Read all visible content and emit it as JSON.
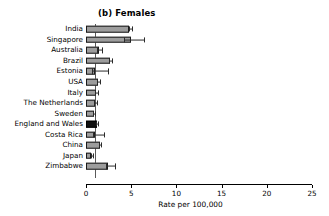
{
  "panel": {
    "label": "(b) Females"
  },
  "axis": {
    "title": "Rate per 100,000",
    "ticks": [
      "0",
      "5",
      "10",
      "15",
      "20",
      "25"
    ],
    "min": 0,
    "max": 25,
    "step": 5
  },
  "colors": {
    "bar_fill": "#9d9d9d",
    "bar_stroke": "#1a1a1a",
    "highlight_fill": "#111111",
    "error_bar": "#2b2b2b",
    "reference_line": "#5a5a5a",
    "background": "#ffffff",
    "text": "#000000"
  },
  "chart_data": {
    "type": "bar",
    "orientation": "horizontal",
    "title": "(b) Females",
    "xlabel": "Rate per 100,000",
    "ylabel": "",
    "xlim": [
      0,
      25
    ],
    "xticks": [
      0,
      5,
      10,
      15,
      20,
      25
    ],
    "grid": false,
    "legend": false,
    "reference_line_x": 1.0,
    "categories": [
      "India",
      "Singapore",
      "Australia",
      "Brazil",
      "Estonia",
      "USA",
      "Italy",
      "The Netherlands",
      "Sweden",
      "England and Wales",
      "Costa Rica",
      "China",
      "Japan",
      "Zimbabwe"
    ],
    "values": [
      4.8,
      5.0,
      1.4,
      2.7,
      1.0,
      1.3,
      1.1,
      1.0,
      0.9,
      1.2,
      1.0,
      1.5,
      0.6,
      2.4
    ],
    "error_low": [
      4.8,
      4.2,
      1.2,
      2.5,
      0.7,
      1.2,
      1.0,
      0.9,
      0.8,
      1.1,
      0.8,
      1.4,
      0.5,
      2.2
    ],
    "error_high": [
      5.1,
      6.4,
      1.8,
      2.9,
      2.4,
      1.5,
      1.3,
      1.2,
      1.0,
      1.3,
      2.0,
      1.7,
      0.8,
      3.2
    ],
    "highlight_category": "England and Wales"
  }
}
